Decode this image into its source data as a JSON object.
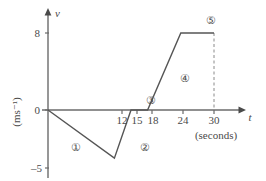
{
  "chart_data": {
    "type": "line",
    "title": "",
    "xlabel": "t",
    "xunits": "(seconds)",
    "ylabel": "v",
    "yunits": "(ms⁻¹)",
    "xlim": [
      0,
      33
    ],
    "ylim": [
      -5,
      8
    ],
    "grid": false,
    "legend": "none",
    "x_ticks": [
      {
        "value": 12,
        "label": "12"
      },
      {
        "value": 15,
        "label": "15"
      },
      {
        "value": 18,
        "label": "18"
      },
      {
        "value": 24,
        "label": "24"
      },
      {
        "value": 30,
        "label": "30"
      }
    ],
    "y_ticks": [
      {
        "value": 8,
        "label": "8"
      },
      {
        "value": 0,
        "label": "0"
      },
      {
        "value": -5,
        "label": "–5"
      }
    ],
    "series": [
      {
        "name": "velocity",
        "points": [
          {
            "t": 0,
            "v": 0
          },
          {
            "t": 12,
            "v": -5
          },
          {
            "t": 15,
            "v": 0
          },
          {
            "t": 18,
            "v": 0
          },
          {
            "t": 24,
            "v": 8
          },
          {
            "t": 30,
            "v": 8
          }
        ]
      }
    ],
    "annotations": [
      {
        "label": "①",
        "t": 6.2,
        "v": -2.35,
        "segment": "0 to 12 s"
      },
      {
        "label": "②",
        "t": 15.6,
        "v": -2.35,
        "segment": "12 to 15 s"
      },
      {
        "label": "③",
        "t": 16.2,
        "v": 0.75,
        "segment": "15 to 18 s"
      },
      {
        "label": "④",
        "t": 23.0,
        "v": 2.75,
        "segment": "18 to 24 s"
      },
      {
        "label": "⑤",
        "t": 28.2,
        "v": 9.3,
        "segment": "24 to 30 s"
      }
    ],
    "dashed_guides": [
      {
        "from": {
          "t": 30,
          "v": 8
        },
        "to": {
          "t": 30,
          "v": 0
        }
      }
    ]
  },
  "axis_labels": {
    "v_axis_name": "v",
    "v_axis_units": "(ms⁻¹)",
    "t_axis_name": "t",
    "t_axis_units": "(seconds)",
    "y_tick_8": "8",
    "y_tick_0": "0",
    "y_tick_neg5": "–5",
    "x_tick_12": "12",
    "x_tick_15": "15",
    "x_tick_18": "18",
    "x_tick_24": "24",
    "x_tick_30": "30"
  },
  "regions": {
    "one": "①",
    "two": "②",
    "three": "③",
    "four": "④",
    "five": "⑤"
  },
  "colors": {
    "ink": "#4a4a4a",
    "line": "#555555",
    "axis": "#6b6b6b",
    "background": "#ffffff"
  }
}
